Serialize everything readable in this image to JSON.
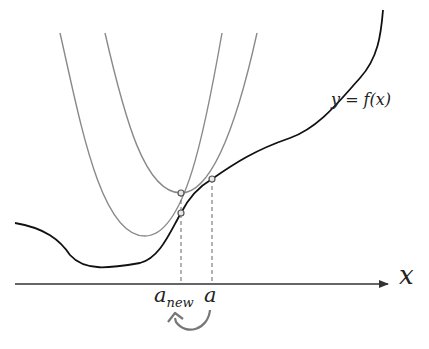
{
  "diagram": {
    "title": "",
    "function_label": "y = f(x)",
    "axis_label": "x",
    "point_labels": {
      "a": "a",
      "a_new_base": "a",
      "a_new_sub": "new"
    },
    "colors": {
      "function_curve": "#111111",
      "parabolas": "#8a8a8a",
      "axis": "#333333",
      "dashes": "#666666",
      "markers_fill": "#e8e8e8",
      "markers_stroke": "#555555",
      "arrow": "#777777"
    },
    "elements": [
      {
        "type": "curve",
        "name": "f(x)",
        "description": "black curve y=f(x)"
      },
      {
        "type": "parabola",
        "name": "quadratic approximation at a",
        "vertex": [
          180,
          193
        ],
        "tangent_point": [
          212,
          179
        ]
      },
      {
        "type": "parabola",
        "name": "quadratic approximation at a_new",
        "vertex": [
          145,
          236
        ],
        "tangent_point": [
          181,
          213
        ]
      },
      {
        "type": "dashed-line",
        "x": 181
      },
      {
        "type": "dashed-line",
        "x": 212
      },
      {
        "type": "curved-arrow",
        "from": "a",
        "to": "a_new"
      }
    ]
  }
}
